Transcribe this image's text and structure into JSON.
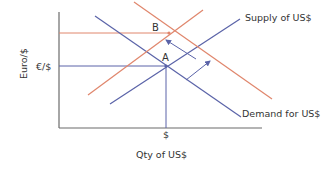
{
  "diagram": {
    "type": "supply-demand",
    "y_axis_label": "Euro/$",
    "x_axis_label": "Qty of US$",
    "y_tick_label": "€/$",
    "x_tick_label": "$",
    "point_a_label": "A",
    "point_b_label": "B",
    "supply_label": "Supply of US$",
    "demand_label": "Demand for US$",
    "colors": {
      "axis": "#6b6b6b",
      "original_curves": "#5a63a8",
      "shifted_curves": "#e0866c",
      "text": "#333333"
    }
  }
}
